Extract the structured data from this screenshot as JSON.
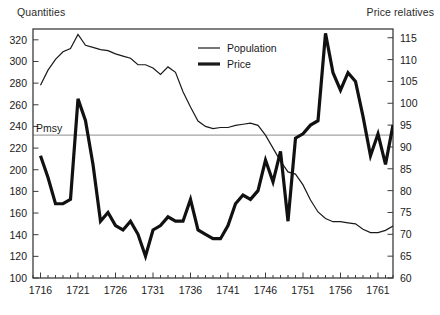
{
  "chart_data": {
    "type": "line",
    "title": "",
    "subtitle": "",
    "xlabel": "",
    "ylabel": "Quantities",
    "y2label": "Price relatives",
    "xlim": [
      1715,
      1763
    ],
    "ylim": [
      100,
      330
    ],
    "y2lim": [
      60,
      117
    ],
    "grid": false,
    "legend_position": "top-center",
    "annotations": [
      {
        "label": "Pmsy",
        "type": "horizontal-reference-line",
        "y_value": 232,
        "axis": "left"
      }
    ],
    "xticks": [
      1716,
      1721,
      1726,
      1731,
      1736,
      1741,
      1746,
      1751,
      1756,
      1761
    ],
    "xtick_labels": [
      "1716",
      "1721",
      "1726",
      "1731",
      "1736",
      "1741",
      "1746",
      "1751",
      "1756",
      "1761"
    ],
    "xtick_minor_every": 1,
    "yticks": [
      100,
      120,
      140,
      160,
      180,
      200,
      220,
      240,
      260,
      280,
      300,
      320
    ],
    "ytick_labels": [
      "100",
      "120",
      "140",
      "160",
      "180",
      "200",
      "220",
      "240",
      "260",
      "280",
      "300",
      "320"
    ],
    "y2ticks": [
      60,
      65,
      70,
      75,
      80,
      85,
      90,
      95,
      100,
      105,
      110,
      115
    ],
    "y2tick_labels": [
      "60",
      "65",
      "70",
      "75",
      "80",
      "85",
      "90",
      "95",
      "100",
      "105",
      "110",
      "115"
    ],
    "x": [
      1716,
      1717,
      1718,
      1719,
      1720,
      1721,
      1722,
      1723,
      1724,
      1725,
      1726,
      1727,
      1728,
      1729,
      1730,
      1731,
      1732,
      1733,
      1734,
      1735,
      1736,
      1737,
      1738,
      1739,
      1740,
      1741,
      1742,
      1743,
      1744,
      1745,
      1746,
      1747,
      1748,
      1749,
      1750,
      1751,
      1752,
      1753,
      1754,
      1755,
      1756,
      1757,
      1758,
      1759,
      1760,
      1761,
      1762,
      1763
    ],
    "series": [
      {
        "name": "Population",
        "axis": "left",
        "line_width": "thin",
        "color": "#1a1a1a",
        "values": [
          278,
          292,
          302,
          309,
          312,
          325,
          315,
          313,
          311,
          310,
          307,
          305,
          303,
          297,
          297,
          294,
          288,
          295,
          290,
          272,
          258,
          245,
          240,
          238,
          239,
          239,
          241,
          242,
          243,
          241,
          232,
          220,
          208,
          198,
          196,
          186,
          172,
          161,
          155,
          152,
          152,
          151,
          150,
          145,
          142,
          142,
          144,
          148
        ]
      },
      {
        "name": "Price",
        "axis": "right",
        "line_width": "thick",
        "color": "#111111",
        "values": [
          88,
          83,
          77,
          77,
          78,
          101,
          96,
          86,
          73,
          75,
          72,
          71,
          73,
          70,
          65,
          71,
          72,
          74,
          73,
          73,
          78,
          71,
          70,
          69,
          69,
          72,
          77,
          79,
          78,
          80,
          87,
          82,
          89,
          73,
          92,
          93,
          95,
          96,
          116,
          107,
          103,
          107,
          105,
          97,
          88,
          93,
          86,
          95
        ]
      }
    ]
  },
  "legend": {
    "items": [
      {
        "label": "Population",
        "style": "thin"
      },
      {
        "label": "Price",
        "style": "thick"
      }
    ]
  },
  "labels": {
    "quantities": "Quantities",
    "price_relatives": "Price relatives",
    "pmsy": "Pmsy"
  },
  "colors": {
    "line": "#1a1a1a",
    "frame": "#3c3c3c",
    "reference_line": "#8c8c8c",
    "background": "#ffffff"
  }
}
